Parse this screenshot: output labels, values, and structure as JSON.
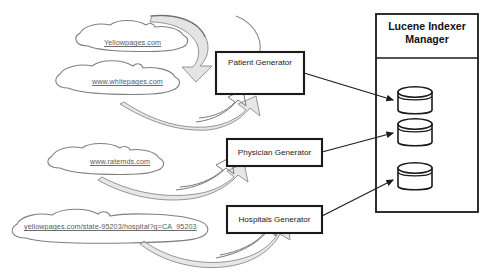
{
  "diagram": {
    "title_panel": {
      "line1": "Lucene Indexer",
      "line2": "Manager"
    },
    "sources": [
      {
        "id": "yellowpages",
        "label": "Yellowpages.com"
      },
      {
        "id": "whitepages",
        "label": "www.whitepages.com"
      },
      {
        "id": "ratemds",
        "label": "www.ratemds.com"
      },
      {
        "id": "yellowpages-hospital",
        "label": "yellowpages.com/state-95203/hospital?g=CA_95203"
      }
    ],
    "processes": [
      {
        "id": "patient",
        "label": "Patient Generator"
      },
      {
        "id": "physician",
        "label": "Physician Generator"
      },
      {
        "id": "hospitals",
        "label": "Hospitals Generator"
      }
    ],
    "stores": [
      {
        "id": "index-1",
        "name": "database-cylinder"
      },
      {
        "id": "index-2",
        "name": "database-cylinder"
      },
      {
        "id": "index-3",
        "name": "database-cylinder"
      }
    ],
    "colors": {
      "stroke_dark": "#1a1a1a",
      "stroke_light": "#808080",
      "shade_fill": "#d4d4d4",
      "label_text": "#5a5a5a",
      "background": "#ffffff"
    }
  }
}
